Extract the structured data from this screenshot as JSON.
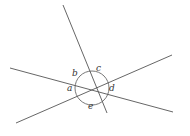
{
  "figure": {
    "background_color": "#ffffff",
    "stroke_color": "#555555",
    "label_color": "#333333",
    "canvas": {
      "width": 190,
      "height": 136
    },
    "intersection_point": {
      "x": 92,
      "y": 88
    },
    "arc_circle": {
      "cx": 92,
      "cy": 88,
      "r": 17
    },
    "lines": [
      {
        "name": "steep-line",
        "description": "steep line from upper-left to lower-right through center",
        "x1": 63,
        "y1": 5,
        "x2": 107,
        "y2": 113
      },
      {
        "name": "shallow-line-left-down",
        "description": "line from left edge sloping down to lower right",
        "x1": 10,
        "y1": 68,
        "x2": 173,
        "y2": 112
      },
      {
        "name": "shallow-line-left-up",
        "description": "line from lower left sloping up to upper right",
        "x1": 16,
        "y1": 123,
        "x2": 172,
        "y2": 55
      }
    ],
    "labels": [
      {
        "name": "angle-label-a",
        "text": "a",
        "x": 67,
        "y": 84
      },
      {
        "name": "angle-label-b",
        "text": "b",
        "x": 72,
        "y": 69
      },
      {
        "name": "angle-label-c",
        "text": "c",
        "x": 96,
        "y": 64
      },
      {
        "name": "angle-label-d",
        "text": "d",
        "x": 109,
        "y": 84
      },
      {
        "name": "angle-label-e",
        "text": "e",
        "x": 88,
        "y": 102
      }
    ]
  }
}
